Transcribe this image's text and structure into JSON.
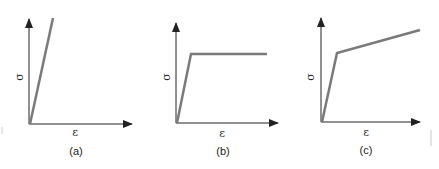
{
  "panels": [
    {
      "id": "a",
      "caption": "(a)",
      "x_label": "ε",
      "y_label": "σ",
      "type": "linear-elastic"
    },
    {
      "id": "b",
      "caption": "(b)",
      "x_label": "ε",
      "y_label": "σ",
      "type": "elastic-perfectly-plastic"
    },
    {
      "id": "c",
      "caption": "(c)",
      "x_label": "ε",
      "y_label": "σ",
      "type": "elastic-linear-hardening"
    }
  ],
  "colors": {
    "axis": "#222222",
    "curve": "#7a7a7a"
  }
}
